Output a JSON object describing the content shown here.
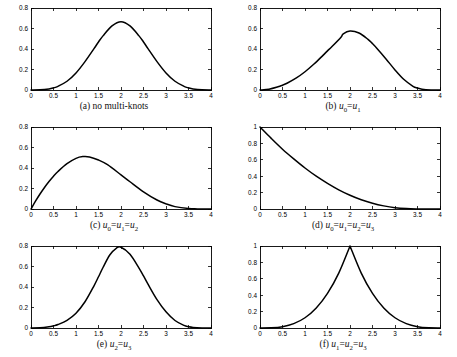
{
  "figure": {
    "columns": 2,
    "rows": 3,
    "background": "#ffffff",
    "curve_color": "#000000",
    "axis_color": "#000000"
  },
  "chart_data": [
    {
      "type": "line",
      "panel_id": "a",
      "title": "",
      "caption": "(a) no multi-knots",
      "caption_parts": [
        {
          "text": "(a) no multi-knots",
          "italic": false
        }
      ],
      "xlabel": "",
      "ylabel": "",
      "xlim": [
        0,
        4
      ],
      "ylim": [
        0,
        0.8
      ],
      "grid": false,
      "legend": "none",
      "xticks": [
        0,
        0.5,
        1,
        1.5,
        2,
        2.5,
        3,
        3.5,
        4
      ],
      "xticklabels": [
        "0",
        "0.5",
        "1",
        "1.5",
        "2",
        "2.5",
        "3",
        "3.5",
        "4"
      ],
      "yticks": [
        0,
        0.2,
        0.4,
        0.6,
        0.8
      ],
      "yticklabels": [
        "0",
        "0.2",
        "0.4",
        "0.6",
        "0.8"
      ],
      "peak": {
        "x": 2.0,
        "y": 0.667
      },
      "x": [
        0,
        0.2,
        0.4,
        0.5,
        0.6,
        0.8,
        1.0,
        1.2,
        1.4,
        1.5,
        1.6,
        1.8,
        2.0,
        2.2,
        2.4,
        2.5,
        2.6,
        2.8,
        3.0,
        3.2,
        3.4,
        3.5,
        3.6,
        3.8,
        4.0
      ],
      "y": [
        0,
        0.0013,
        0.0107,
        0.0208,
        0.036,
        0.0853,
        0.1667,
        0.2773,
        0.404,
        0.4688,
        0.528,
        0.6253,
        0.6667,
        0.6253,
        0.528,
        0.4688,
        0.404,
        0.2773,
        0.1667,
        0.0853,
        0.036,
        0.0208,
        0.0107,
        0.0013,
        0
      ]
    },
    {
      "type": "line",
      "panel_id": "b",
      "title": "",
      "caption": "(b) u0=u1",
      "caption_parts": [
        {
          "text": "(b) ",
          "italic": false
        },
        {
          "text": "u",
          "italic": true,
          "sub": "0"
        },
        {
          "text": "=",
          "italic": false
        },
        {
          "text": "u",
          "italic": true,
          "sub": "1"
        }
      ],
      "xlabel": "",
      "ylabel": "",
      "xlim": [
        0,
        4
      ],
      "ylim": [
        0,
        0.8
      ],
      "grid": false,
      "legend": "none",
      "xticks": [
        0,
        0.5,
        1,
        1.5,
        2,
        2.5,
        3,
        3.5,
        4
      ],
      "xticklabels": [
        "0",
        "0.5",
        "1",
        "1.5",
        "2",
        "2.5",
        "3",
        "3.5",
        "4"
      ],
      "yticks": [
        0,
        0.2,
        0.4,
        0.6,
        0.8
      ],
      "yticklabels": [
        "0",
        "0.2",
        "0.4",
        "0.6",
        "0.8"
      ],
      "peak": {
        "x": 1.85,
        "y": 0.58
      },
      "x": [
        0,
        0.2,
        0.4,
        0.5,
        0.6,
        0.8,
        1.0,
        1.2,
        1.4,
        1.5,
        1.6,
        1.8,
        1.85,
        2.0,
        2.2,
        2.4,
        2.5,
        2.6,
        2.8,
        3.0,
        3.2,
        3.4,
        3.5,
        3.6,
        3.8,
        4.0
      ],
      "y": [
        0,
        0.008,
        0.031,
        0.047,
        0.066,
        0.115,
        0.178,
        0.253,
        0.338,
        0.382,
        0.424,
        0.515,
        0.548,
        0.575,
        0.556,
        0.494,
        0.452,
        0.405,
        0.303,
        0.196,
        0.102,
        0.036,
        0.019,
        0.008,
        0.001,
        0
      ]
    },
    {
      "type": "line",
      "panel_id": "c",
      "title": "",
      "caption": "(c) u0=u1=u2",
      "caption_parts": [
        {
          "text": "(c) ",
          "italic": false
        },
        {
          "text": "u",
          "italic": true,
          "sub": "0"
        },
        {
          "text": "=",
          "italic": false
        },
        {
          "text": "u",
          "italic": true,
          "sub": "1"
        },
        {
          "text": "=",
          "italic": false
        },
        {
          "text": "u",
          "italic": true,
          "sub": "2"
        }
      ],
      "xlabel": "",
      "ylabel": "",
      "xlim": [
        0,
        4
      ],
      "ylim": [
        0,
        0.8
      ],
      "grid": false,
      "legend": "none",
      "xticks": [
        0,
        0.5,
        1,
        1.5,
        2,
        2.5,
        3,
        3.5,
        4
      ],
      "xticklabels": [
        "0",
        "0.5",
        "1",
        "1.5",
        "2",
        "2.5",
        "3",
        "3.5",
        "4"
      ],
      "yticks": [
        0,
        0.2,
        0.4,
        0.6,
        0.8
      ],
      "yticklabels": [
        "0",
        "0.2",
        "0.4",
        "0.6",
        "0.8"
      ],
      "peak": {
        "x": 1.15,
        "y": 0.51
      },
      "x": [
        0,
        0.1,
        0.2,
        0.3,
        0.4,
        0.5,
        0.6,
        0.8,
        1.0,
        1.15,
        1.3,
        1.5,
        1.7,
        2.0,
        2.2,
        2.5,
        2.8,
        3.0,
        3.2,
        3.5,
        3.7,
        4.0
      ],
      "y": [
        0,
        0.076,
        0.146,
        0.21,
        0.268,
        0.32,
        0.366,
        0.442,
        0.494,
        0.511,
        0.508,
        0.478,
        0.432,
        0.333,
        0.266,
        0.168,
        0.088,
        0.05,
        0.023,
        0.004,
        0.001,
        0
      ]
    },
    {
      "type": "line",
      "panel_id": "d",
      "title": "",
      "caption": "(d) u0=u1=u2=u3",
      "caption_parts": [
        {
          "text": "(d) ",
          "italic": false
        },
        {
          "text": "u",
          "italic": true,
          "sub": "0"
        },
        {
          "text": "=",
          "italic": false
        },
        {
          "text": "u",
          "italic": true,
          "sub": "1"
        },
        {
          "text": "=",
          "italic": false
        },
        {
          "text": "u",
          "italic": true,
          "sub": "2"
        },
        {
          "text": "=",
          "italic": false
        },
        {
          "text": "u",
          "italic": true,
          "sub": "3"
        }
      ],
      "xlabel": "",
      "ylabel": "",
      "xlim": [
        0,
        4
      ],
      "ylim": [
        0,
        1
      ],
      "grid": false,
      "legend": "none",
      "xticks": [
        0,
        0.5,
        1,
        1.5,
        2,
        2.5,
        3,
        3.5,
        4
      ],
      "xticklabels": [
        "0",
        "0.5",
        "1",
        "1.5",
        "2",
        "2.5",
        "3",
        "3.5",
        "4"
      ],
      "yticks": [
        0,
        0.2,
        0.4,
        0.6,
        0.8,
        1
      ],
      "yticklabels": [
        "0",
        "0.2",
        "0.4",
        "0.6",
        "0.8",
        "1"
      ],
      "peak": {
        "x": 0.0,
        "y": 1.0
      },
      "x": [
        0,
        0.25,
        0.5,
        0.75,
        1.0,
        1.25,
        1.5,
        1.75,
        2.0,
        2.25,
        2.5,
        2.75,
        3.0,
        3.25,
        3.5,
        3.75,
        4.0
      ],
      "y": [
        1.0,
        0.861,
        0.729,
        0.611,
        0.5,
        0.4,
        0.313,
        0.234,
        0.168,
        0.113,
        0.07,
        0.038,
        0.016,
        0.005,
        0.001,
        0.0,
        0.0
      ]
    },
    {
      "type": "line",
      "panel_id": "e",
      "title": "",
      "caption": "(e) u2=u3",
      "caption_parts": [
        {
          "text": "(e) ",
          "italic": false
        },
        {
          "text": "u",
          "italic": true,
          "sub": "2"
        },
        {
          "text": "=",
          "italic": false
        },
        {
          "text": "u",
          "italic": true,
          "sub": "3"
        }
      ],
      "xlabel": "",
      "ylabel": "",
      "xlim": [
        0,
        4
      ],
      "ylim": [
        0,
        0.8
      ],
      "grid": false,
      "legend": "none",
      "xticks": [
        0,
        0.5,
        1,
        1.5,
        2,
        2.5,
        3,
        3.5,
        4
      ],
      "xticklabels": [
        "0",
        "0.5",
        "1",
        "1.5",
        "2",
        "2.5",
        "3",
        "3.5",
        "4"
      ],
      "yticks": [
        0,
        0.2,
        0.4,
        0.6,
        0.8
      ],
      "yticklabels": [
        "0",
        "0.2",
        "0.4",
        "0.6",
        "0.8"
      ],
      "peak": {
        "x": 1.75,
        "y": 0.79
      },
      "x": [
        0,
        0.2,
        0.4,
        0.5,
        0.6,
        0.8,
        1.0,
        1.2,
        1.4,
        1.5,
        1.6,
        1.75,
        1.9,
        2.0,
        2.2,
        2.4,
        2.5,
        2.6,
        2.8,
        3.0,
        3.2,
        3.4,
        3.5,
        3.6,
        3.8,
        4.0
      ],
      "y": [
        0,
        0.002,
        0.012,
        0.021,
        0.034,
        0.075,
        0.144,
        0.256,
        0.412,
        0.5,
        0.59,
        0.712,
        0.78,
        0.788,
        0.72,
        0.585,
        0.508,
        0.428,
        0.277,
        0.158,
        0.073,
        0.025,
        0.013,
        0.006,
        0.001,
        0
      ]
    },
    {
      "type": "line",
      "panel_id": "f",
      "title": "",
      "caption": "(f)  u1=u2=u3",
      "caption_parts": [
        {
          "text": "(f)   ",
          "italic": false
        },
        {
          "text": "u",
          "italic": true,
          "sub": "1"
        },
        {
          "text": "=",
          "italic": false
        },
        {
          "text": "u",
          "italic": true,
          "sub": "2"
        },
        {
          "text": "=",
          "italic": false
        },
        {
          "text": "u",
          "italic": true,
          "sub": "3"
        }
      ],
      "xlabel": "",
      "ylabel": "",
      "xlim": [
        0,
        4
      ],
      "ylim": [
        0,
        1
      ],
      "grid": false,
      "legend": "none",
      "xticks": [
        0,
        0.5,
        1,
        1.5,
        2,
        2.5,
        3,
        3.5,
        4
      ],
      "xticklabels": [
        "0",
        "0.5",
        "1",
        "1.5",
        "2",
        "2.5",
        "3",
        "3.5",
        "4"
      ],
      "yticks": [
        0,
        0.2,
        0.4,
        0.6,
        0.8,
        1
      ],
      "yticklabels": [
        "0",
        "0.2",
        "0.4",
        "0.6",
        "0.8",
        "1"
      ],
      "peak": {
        "x": 2.0,
        "y": 1.0
      },
      "x": [
        0,
        0.25,
        0.5,
        0.75,
        1.0,
        1.25,
        1.5,
        1.75,
        2.0,
        2.25,
        2.5,
        2.75,
        3.0,
        3.25,
        3.5,
        3.75,
        4.0
      ],
      "y": [
        0.0,
        0.002,
        0.016,
        0.053,
        0.125,
        0.244,
        0.422,
        0.67,
        1.0,
        0.67,
        0.422,
        0.244,
        0.125,
        0.053,
        0.016,
        0.002,
        0.0
      ]
    }
  ]
}
